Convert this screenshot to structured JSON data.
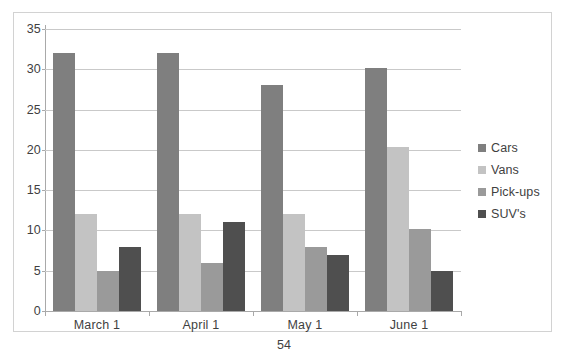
{
  "chart_data": {
    "type": "bar",
    "title": "",
    "subtitle": "",
    "xlabel": "",
    "ylabel": "",
    "categories": [
      "March 1",
      "April 1",
      "May 1",
      "June 1"
    ],
    "series": [
      {
        "name": "Cars",
        "color": "#7f7f7f",
        "values": [
          32,
          32,
          28,
          30.2
        ]
      },
      {
        "name": "Vans",
        "color": "#c3c3c3",
        "values": [
          12,
          12,
          12,
          20.3
        ]
      },
      {
        "name": "Pick-ups",
        "color": "#9a9a9a",
        "values": [
          5,
          6,
          8,
          10.2
        ]
      },
      {
        "name": "SUV's",
        "color": "#4f4f4f",
        "values": [
          8,
          11,
          7,
          5
        ]
      }
    ],
    "ylim": [
      0,
      35
    ],
    "ytick_step": 5,
    "yticks": [
      "0",
      "5",
      "10",
      "15",
      "20",
      "25",
      "30",
      "35"
    ],
    "grid": true,
    "legend_position": "right"
  },
  "legend": {
    "entries": [
      {
        "label": "Cars"
      },
      {
        "label": "Vans"
      },
      {
        "label": "Pick-ups"
      },
      {
        "label": "SUV's"
      }
    ]
  },
  "page": {
    "number": "54"
  },
  "colors": {
    "frame_border": "#d2d2d2",
    "gridline": "#c9c9c9",
    "axis": "#a9a9a9",
    "text": "#3f3f3f",
    "background": "#ffffff"
  }
}
